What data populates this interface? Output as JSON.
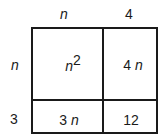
{
  "diagram": {
    "type": "area-model-grid",
    "column_headers": [
      {
        "text": "n",
        "italic": true
      },
      {
        "text": "4",
        "italic": false
      }
    ],
    "row_headers": [
      {
        "text": "n",
        "italic": true
      },
      {
        "text": "3",
        "italic": false
      }
    ],
    "cells": {
      "r0c0": {
        "base": "n",
        "exponent": "2"
      },
      "r0c1": {
        "coef": "4",
        "var": "n"
      },
      "r1c0": {
        "coef": "3",
        "var": "n"
      },
      "r1c1": {
        "text": "12"
      }
    }
  }
}
